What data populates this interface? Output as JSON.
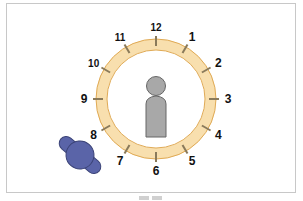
{
  "diagram": {
    "type": "clock-position-diagram",
    "clock": {
      "center": [
        156,
        99
      ],
      "outer_radius": 60,
      "inner_radius": 49,
      "ring_fill": "#f8dfae",
      "ring_stroke": "#e0aa55",
      "tick_color": "#8a7a5a",
      "hours": [
        {
          "label": "12",
          "angle": 0
        },
        {
          "label": "1",
          "angle": 30
        },
        {
          "label": "2",
          "angle": 60
        },
        {
          "label": "3",
          "angle": 90
        },
        {
          "label": "4",
          "angle": 120
        },
        {
          "label": "5",
          "angle": 150
        },
        {
          "label": "6",
          "angle": 180
        },
        {
          "label": "7",
          "angle": 210
        },
        {
          "label": "8",
          "angle": 240
        },
        {
          "label": "9",
          "angle": 270
        },
        {
          "label": "10",
          "angle": 300
        },
        {
          "label": "11",
          "angle": 330
        }
      ]
    },
    "person": {
      "color": "#a8a8a8",
      "stroke": "#666666"
    },
    "object": {
      "color": "#5a64a8",
      "stroke": "#3c4478",
      "position": "near 8 o'clock, outside ring"
    }
  }
}
